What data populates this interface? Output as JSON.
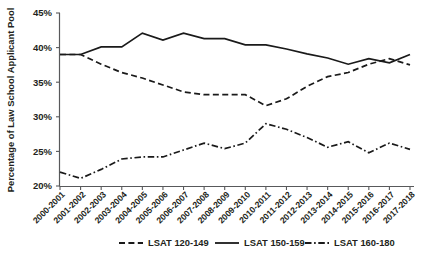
{
  "chart_data": {
    "type": "line",
    "title": "",
    "xlabel": "",
    "ylabel": "Percentage of Law School Applicant Pool",
    "ylim": [
      20,
      45
    ],
    "yticks": [
      20,
      25,
      30,
      35,
      40,
      45
    ],
    "ytick_labels": [
      "20%",
      "25%",
      "30%",
      "35%",
      "40%",
      "45%"
    ],
    "grid": false,
    "legend_position": "bottom",
    "categories": [
      "2000-2001",
      "2001-2002",
      "2002-2003",
      "2003-2004",
      "2004-2005",
      "2005-2006",
      "2006-2007",
      "2007-2008",
      "2008-2009",
      "2009-2010",
      "2010-2011",
      "2011-2012",
      "2012-2013",
      "2013-2014",
      "2014-2015",
      "2015-2016",
      "2016-2017",
      "2017-2018"
    ],
    "series": [
      {
        "name": "LSAT 120-149",
        "style": "dashed",
        "values": [
          39.0,
          39.0,
          37.6,
          36.4,
          35.6,
          34.6,
          33.6,
          33.2,
          33.2,
          33.2,
          31.6,
          32.6,
          34.4,
          35.8,
          36.4,
          37.6,
          38.4,
          37.5
        ]
      },
      {
        "name": "LSAT 150-159",
        "style": "solid",
        "values": [
          39.0,
          39.0,
          40.1,
          40.1,
          42.1,
          41.1,
          42.1,
          41.3,
          41.3,
          40.4,
          40.4,
          39.8,
          39.1,
          38.5,
          37.6,
          38.4,
          37.8,
          39.0
        ]
      },
      {
        "name": "LSAT 160-180",
        "style": "dashdot",
        "values": [
          22.0,
          21.1,
          22.4,
          23.9,
          24.2,
          24.2,
          25.2,
          26.2,
          25.4,
          26.2,
          29.0,
          28.2,
          27.0,
          25.6,
          26.4,
          24.8,
          26.2,
          25.3
        ]
      }
    ]
  },
  "legend": {
    "items": [
      {
        "label": "LSAT 120-149",
        "style": "dashed"
      },
      {
        "label": "LSAT 150-159",
        "style": "solid"
      },
      {
        "label": "LSAT 160-180",
        "style": "dashdot"
      }
    ]
  }
}
